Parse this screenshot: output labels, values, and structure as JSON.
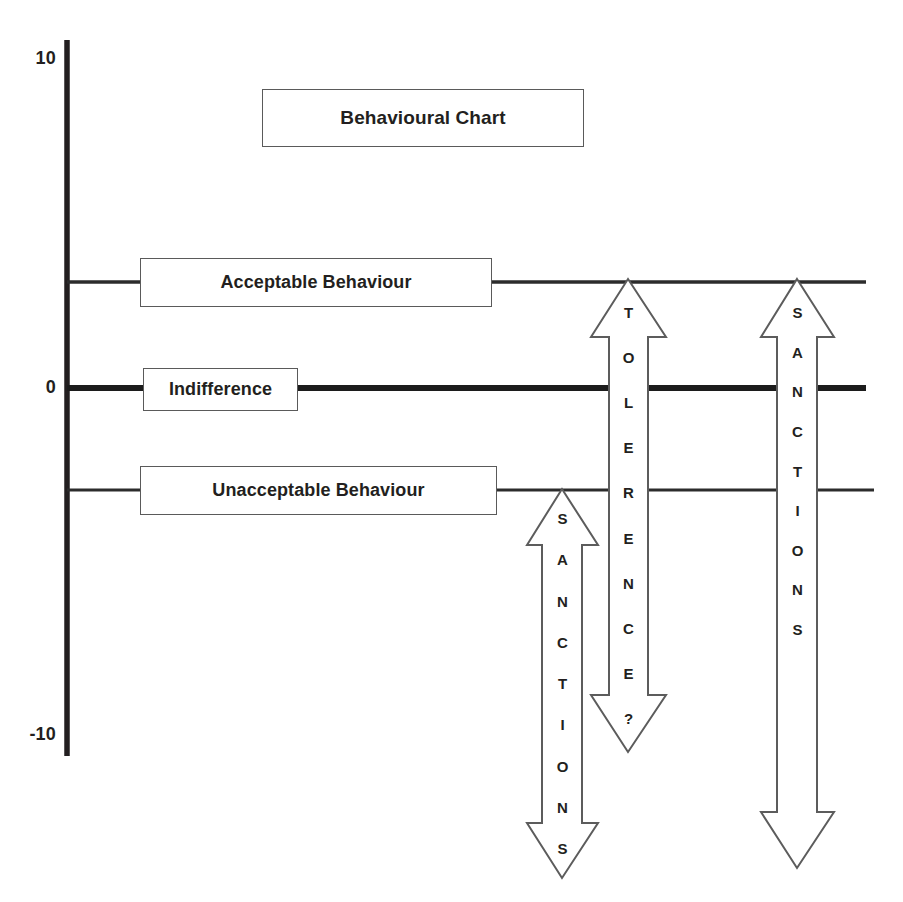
{
  "figure": {
    "title": "Behavioural Chart",
    "kind": "behavioural-threshold-diagram"
  },
  "axis": {
    "name": "vertical-scale",
    "ticks": [
      {
        "label": "10",
        "value": 10
      },
      {
        "label": "0",
        "value": 0
      },
      {
        "label": "-10",
        "value": -10
      }
    ]
  },
  "levels": [
    {
      "key": "acceptable",
      "label": "Acceptable Behaviour",
      "value": 3,
      "line_weight": "thin"
    },
    {
      "key": "indifference",
      "label": "Indifference",
      "value": 0,
      "line_weight": "thick"
    },
    {
      "key": "unacceptable",
      "label": "Unacceptable Behaviour",
      "value": -3,
      "line_weight": "thin"
    }
  ],
  "arrows": [
    {
      "key": "left-sanctions",
      "label": "SANCTIONS",
      "letters": [
        "S",
        "A",
        "N",
        "C",
        "T",
        "I",
        "O",
        "N",
        "S"
      ],
      "heads": "double",
      "from_level": "unacceptable",
      "to_value": -10
    },
    {
      "key": "middle-tolerence",
      "label": "TOLERENCE?",
      "letters": [
        "T",
        "O",
        "L",
        "E",
        "R",
        "E",
        "N",
        "C",
        "E",
        "?"
      ],
      "heads": "double",
      "from_level": "acceptable",
      "to_value": -8
    },
    {
      "key": "right-sanctions",
      "label": "SANCTIONS",
      "letters": [
        "S",
        "A",
        "N",
        "C",
        "T",
        "I",
        "O",
        "N",
        "S"
      ],
      "heads": "double",
      "from_level": "acceptable",
      "to_value": -10
    }
  ],
  "colors": {
    "ink": "#231f20",
    "line": "#3b3b3b",
    "box_border": "#5a5a5a",
    "background": "#ffffff"
  }
}
